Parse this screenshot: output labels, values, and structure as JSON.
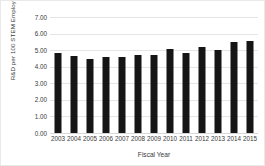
{
  "chart_data": {
    "type": "bar",
    "title": "",
    "subtitle": "",
    "xlabel": "Fiscal Year",
    "ylabel": "R&D per 100 STEM Employees - DOI",
    "categories": [
      "2003",
      "2004",
      "2005",
      "2006",
      "2007",
      "2008",
      "2009",
      "2010",
      "2011",
      "2012",
      "2013",
      "2014",
      "2015"
    ],
    "values": [
      4.8,
      4.62,
      4.45,
      4.58,
      4.57,
      4.73,
      4.7,
      5.07,
      4.82,
      5.18,
      5.03,
      5.48,
      5.58
    ],
    "series": [
      {
        "name": "R&D per 100 STEM Employees - DOI",
        "values": [
          4.8,
          4.62,
          4.45,
          4.58,
          4.57,
          4.73,
          4.7,
          5.07,
          4.82,
          5.18,
          5.03,
          5.48,
          5.58
        ]
      }
    ],
    "ylim": [
      0.0,
      7.0
    ],
    "ytick_values": [
      0.0,
      1.0,
      2.0,
      3.0,
      4.0,
      5.0,
      6.0,
      7.0
    ],
    "ytick_labels": [
      "0.00",
      "1.00",
      "2.00",
      "3.00",
      "4.00",
      "5.00",
      "6.00",
      "7.00"
    ],
    "grid": true,
    "grid_axis": "y",
    "legend": false,
    "legend_position": "none",
    "bar_color": "#151515",
    "grid_color": "#e4e4e4",
    "text_color": "#3a3a3a",
    "background_color": "#ffffff"
  }
}
